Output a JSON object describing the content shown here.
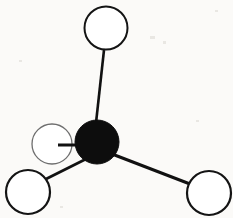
{
  "figure": {
    "kind": "ball-and-stick-molecular-model",
    "background_color": "#fbfaf8",
    "width": 233,
    "height": 218
  },
  "style": {
    "central_atom_fill": "#0d0d0d",
    "peripheral_atom_fill": "#ffffff",
    "peripheral_atom_stroke": "#141414",
    "back_atom_stroke": "#6e6e6e",
    "bond_color": "#111111"
  },
  "atoms": [
    {
      "id": "central-atom",
      "label": "central atom",
      "role": "center",
      "cx": 97,
      "cy": 142,
      "r": 22,
      "fill": "#0d0d0d",
      "stroke": "#0d0d0d",
      "stroke_width": 1,
      "depth": "front"
    },
    {
      "id": "atom-top",
      "label": "top atom",
      "role": "peripheral",
      "cx": 106,
      "cy": 28,
      "r": 21.5,
      "fill": "#ffffff",
      "stroke": "#141414",
      "stroke_width": 2,
      "depth": "front"
    },
    {
      "id": "atom-bottom-left",
      "label": "bottom left atom",
      "role": "peripheral",
      "cx": 28,
      "cy": 192,
      "r": 22,
      "fill": "#ffffff",
      "stroke": "#141414",
      "stroke_width": 2.2,
      "depth": "front"
    },
    {
      "id": "atom-bottom-right",
      "label": "bottom right atom",
      "role": "peripheral",
      "cx": 209,
      "cy": 193,
      "r": 22,
      "fill": "#ffffff",
      "stroke": "#141414",
      "stroke_width": 2.2,
      "depth": "front"
    },
    {
      "id": "atom-left-back",
      "label": "left rear atom",
      "role": "peripheral",
      "cx": 52,
      "cy": 144,
      "r": 20,
      "fill": "#ffffff",
      "stroke": "#6e6e6e",
      "stroke_width": 1.3,
      "depth": "back"
    }
  ],
  "bonds": [
    {
      "id": "bond-center-top",
      "label": "bond to top atom",
      "from": "central-atom",
      "to": "atom-top",
      "x1": 104,
      "y1": 50,
      "x2": 95,
      "y2": 132,
      "width": 2.6,
      "color": "#111111"
    },
    {
      "id": "bond-center-bottom-left",
      "label": "bond to bottom left atom",
      "from": "central-atom",
      "to": "atom-bottom-left",
      "x1": 88,
      "y1": 158,
      "x2": 44,
      "y2": 180,
      "width": 2.8,
      "color": "#111111"
    },
    {
      "id": "bond-center-bottom-right",
      "label": "bond to bottom right atom",
      "from": "central-atom",
      "to": "atom-bottom-right",
      "x1": 112,
      "y1": 154,
      "x2": 190,
      "y2": 184,
      "width": 3.0,
      "color": "#111111"
    },
    {
      "id": "bond-center-left-back",
      "label": "bond to left rear atom",
      "from": "central-atom",
      "to": "atom-left-back",
      "x1": 96,
      "y1": 145,
      "x2": 58,
      "y2": 145,
      "width": 3.0,
      "color": "#111111"
    }
  ],
  "specks": [
    {
      "x": 150,
      "y": 36,
      "w": 5,
      "h": 3
    },
    {
      "x": 163,
      "y": 41,
      "w": 3,
      "h": 3
    },
    {
      "x": 215,
      "y": 10,
      "w": 3,
      "h": 2
    },
    {
      "x": 19,
      "y": 60,
      "w": 3,
      "h": 2
    },
    {
      "x": 196,
      "y": 120,
      "w": 3,
      "h": 2
    },
    {
      "x": 60,
      "y": 206,
      "w": 3,
      "h": 2
    }
  ]
}
